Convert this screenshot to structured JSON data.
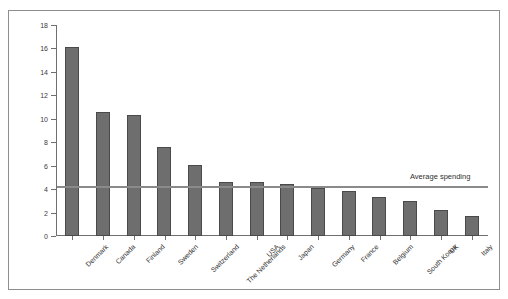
{
  "caption": "",
  "chart_data": {
    "type": "bar",
    "title": "",
    "xlabel": "",
    "ylabel": "%",
    "ylim": [
      0,
      18
    ],
    "ytick_values": [
      0,
      2,
      4,
      6,
      8,
      10,
      12,
      14,
      16,
      18
    ],
    "ytick_labels": [
      "0",
      "2",
      "4",
      "6",
      "8",
      "10",
      "12",
      "14",
      "16",
      "18"
    ],
    "grid": false,
    "legend": "none",
    "categories": [
      "Denmark",
      "Canada",
      "Finland",
      "Sweden",
      "Switzerland",
      "The Netherlands",
      "USA",
      "Japan",
      "Germany",
      "France",
      "Belgium",
      "South Korea",
      "UK",
      "Italy"
    ],
    "values": [
      16.1,
      10.6,
      10.3,
      7.6,
      6.1,
      4.6,
      4.6,
      4.4,
      4.1,
      3.8,
      3.3,
      3.0,
      2.2,
      1.7
    ],
    "annotations": [
      {
        "label": "Average spending",
        "type": "hline",
        "value": 4.3
      }
    ],
    "colors": {
      "bar_fill": "#6e6e6e",
      "bar_border": "#4a4a4a",
      "axis": "#6f6f6f",
      "average_line": "#8a8a8a",
      "frame": "#8e8e8e",
      "text": "#2f2f2f"
    }
  }
}
